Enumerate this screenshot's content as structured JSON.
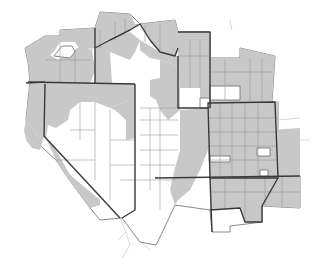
{
  "map": {
    "description": "Western United States county map with shaded counties",
    "colors": {
      "shaded": "#c8c8c8",
      "unshaded": "#ffffff",
      "state_border": "#3a3a3a",
      "county_border": "#9a9a9a"
    },
    "regions": [
      {
        "name": "northwest",
        "shaded": true
      },
      {
        "name": "oregon",
        "shaded": true
      },
      {
        "name": "california-coast-and-east",
        "shaded": true
      },
      {
        "name": "nevada",
        "shaded": false
      },
      {
        "name": "idaho-montana",
        "shaded": true
      },
      {
        "name": "wyoming",
        "shaded": true
      },
      {
        "name": "utah",
        "shaded": false
      },
      {
        "name": "colorado",
        "shaded": true
      },
      {
        "name": "new-mexico-north",
        "shaded": true
      },
      {
        "name": "arizona-new-mexico-south",
        "shaded": false
      }
    ]
  }
}
